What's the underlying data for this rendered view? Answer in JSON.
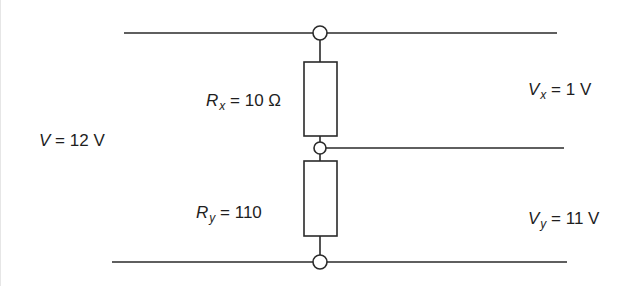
{
  "diagram": {
    "colors": {
      "wire": "#2a2a2a",
      "text": "#1e1e1e",
      "background": "#ffffff"
    },
    "supply": {
      "symbol": "V",
      "equals": "=",
      "value": "12 V"
    },
    "resistor_x": {
      "symbol": "R",
      "subscript": "x",
      "equals": "=",
      "value": "10 Ω"
    },
    "resistor_y": {
      "symbol": "R",
      "subscript": "y",
      "equals": "=",
      "value": "110"
    },
    "voltage_x": {
      "symbol": "V",
      "subscript": "x",
      "equals": "=",
      "value": "1 V"
    },
    "voltage_y": {
      "symbol": "V",
      "subscript": "y",
      "equals": "=",
      "value": "11 V"
    },
    "nodes": [
      "top-node",
      "middle-node",
      "bottom-node"
    ],
    "components": [
      "top-rail",
      "resistor-rx",
      "middle-tap",
      "resistor-ry",
      "bottom-rail"
    ]
  }
}
